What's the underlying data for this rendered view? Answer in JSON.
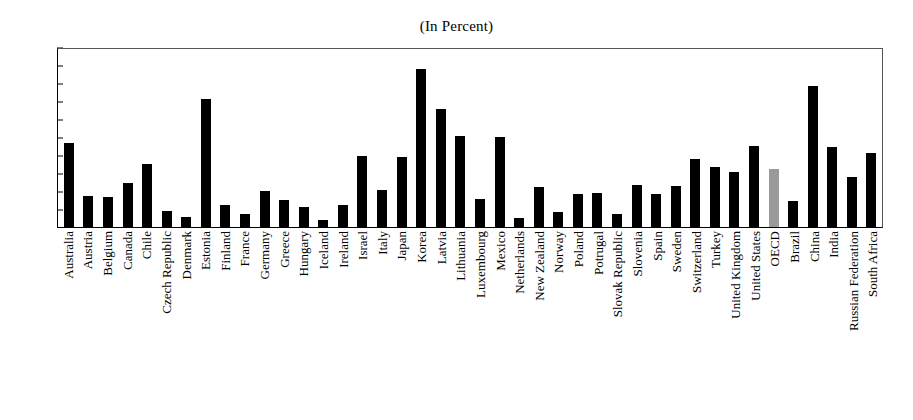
{
  "chart_data": {
    "type": "bar",
    "title": "(In Percent)",
    "xlabel": "",
    "ylabel": "",
    "ylim": [
      0,
      50
    ],
    "ytick_step": 5,
    "yticks": [
      0,
      5,
      10,
      15,
      20,
      25,
      30,
      35,
      40,
      45,
      50
    ],
    "grid": false,
    "legend": false,
    "bar_color": "#000000",
    "highlight_color": "#9a9a9a",
    "highlight_category": "OECD",
    "categories": [
      "Australia",
      "Austria",
      "Belgium",
      "Canada",
      "Chile",
      "Czech Republic",
      "Denmark",
      "Estonia",
      "Finland",
      "France",
      "Germany",
      "Greece",
      "Hungary",
      "Iceland",
      "Ireland",
      "Israel",
      "Italy",
      "Japan",
      "Korea",
      "Latvia",
      "Lithuania",
      "Luxembourg",
      "Mexico",
      "Netherlands",
      "New Zealand",
      "Norway",
      "Poland",
      "Potrugal",
      "Slovak Republic",
      "Slovenia",
      "Spain",
      "Sweden",
      "Switzerland",
      "Turkey",
      "United Kingdom",
      "United States",
      "OECD",
      "Brazil",
      "China",
      "India",
      "Russian Federation",
      "South Africa"
    ],
    "values": [
      23.2,
      8.6,
      8.4,
      12.1,
      17.6,
      4.5,
      2.8,
      35.6,
      6.2,
      3.5,
      9.9,
      7.5,
      5.6,
      1.9,
      6.2,
      19.8,
      10.3,
      19.4,
      43.8,
      32.9,
      25.3,
      7.8,
      24.9,
      2.4,
      11.0,
      4.2,
      9.3,
      9.4,
      3.7,
      11.7,
      9.3,
      11.3,
      19.0,
      16.8,
      15.3,
      22.4,
      16.0,
      7.2,
      39.3,
      22.2,
      13.8,
      20.6
    ]
  }
}
